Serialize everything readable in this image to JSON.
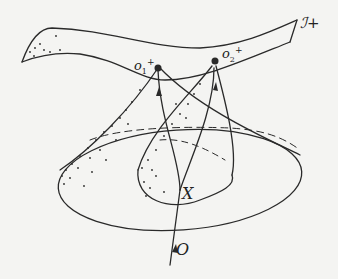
{
  "diagram": {
    "type": "spacetime light-cone diagram",
    "labels": {
      "scri_plus": "ℐ+",
      "o1": "o",
      "o1_sub": "1",
      "o1_sup": "+",
      "o2": "o",
      "o2_sub": "2",
      "o2_sup": "+",
      "event_x": "X",
      "observer_o": "O"
    },
    "nodes": [
      {
        "id": "o1_plus",
        "label": "o1+",
        "kind": "point on future null infinity"
      },
      {
        "id": "o2_plus",
        "label": "o2+",
        "kind": "point on future null infinity"
      },
      {
        "id": "X",
        "label": "X",
        "kind": "event"
      },
      {
        "id": "O",
        "label": "O",
        "kind": "observer worldline origin"
      }
    ],
    "edges": [
      {
        "from": "O",
        "to": "X",
        "style": "worldline with arrow"
      },
      {
        "from": "X",
        "to": "o1_plus",
        "style": "curved worldline with arrow"
      },
      {
        "from": "X",
        "to": "o2_plus",
        "style": "curved worldline with arrow"
      }
    ],
    "shapes": [
      {
        "id": "scri",
        "kind": "ribbon surface",
        "label": "ℐ+"
      },
      {
        "id": "cone1",
        "kind": "past light cone",
        "apex": "o1_plus"
      },
      {
        "id": "cone2",
        "kind": "past light cone",
        "apex": "o2_plus"
      }
    ],
    "colors": {
      "ink": "#2a2a2a",
      "paper": "#f4f4f2"
    }
  }
}
